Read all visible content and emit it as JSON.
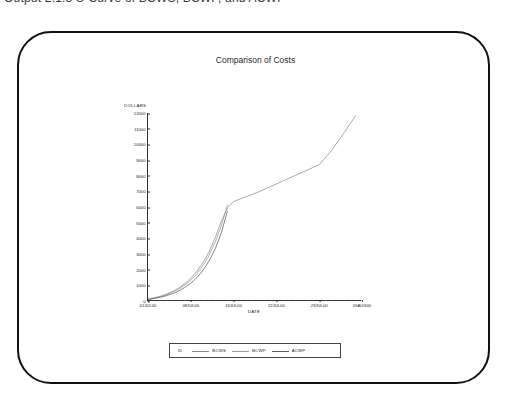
{
  "caption": {
    "text": "Output 2.1.3  S-Curve of BCWS, BCWP, and ACWP"
  },
  "frame": {
    "name": "rounded-display-frame",
    "border_color": "#111111"
  },
  "chart_data": {
    "type": "line",
    "title": "Comparison of Costs",
    "xlabel": "DATE",
    "ylabel": "DOLLARS",
    "grid": false,
    "legend_position": "bottom",
    "legend_id_label": "ID",
    "ylim": [
      0,
      12000
    ],
    "yticks": [
      0,
      1000,
      2000,
      3000,
      4000,
      5000,
      6000,
      7000,
      8000,
      9000,
      10000,
      11000,
      12000
    ],
    "ytick_labels": [
      "0",
      "1000",
      "2000",
      "3000",
      "4000",
      "5000",
      "6000",
      "7000",
      "8000",
      "9000",
      "10000",
      "11000",
      "12000"
    ],
    "xticks": [
      "01JUL00",
      "08JUL00",
      "15JUL00",
      "22JUL00",
      "29JUL00",
      "05AUG00"
    ],
    "xlim": [
      "01JUL00",
      "05AUG00"
    ],
    "x_days": [
      0,
      7,
      14,
      21,
      28,
      35
    ],
    "series": [
      {
        "name": "BCWS",
        "color": "#8c8c8c",
        "x_days": [
          0,
          1,
          2,
          3,
          4,
          5,
          6,
          7,
          8,
          9,
          10,
          11,
          12,
          13,
          14,
          16,
          18,
          20,
          22,
          24,
          26,
          28,
          30,
          32,
          34
        ],
        "values": [
          120,
          200,
          300,
          430,
          600,
          820,
          1100,
          1450,
          1900,
          2450,
          3150,
          4050,
          5100,
          5950,
          6350,
          6650,
          6950,
          7300,
          7650,
          8000,
          8350,
          8700,
          9600,
          10700,
          11850
        ]
      },
      {
        "name": "BCWP",
        "color": "#9a9a9a",
        "x_days": [
          0,
          1,
          2,
          3,
          4,
          5,
          6,
          7,
          8,
          9,
          10,
          11,
          12,
          13
        ],
        "values": [
          110,
          185,
          280,
          400,
          560,
          760,
          1010,
          1330,
          1740,
          2260,
          2920,
          3760,
          4800,
          6150
        ]
      },
      {
        "name": "ACWP",
        "color": "#5c5c5c",
        "x_days": [
          0,
          1,
          2,
          3,
          4,
          5,
          6,
          7,
          8,
          9,
          10,
          11,
          12,
          13
        ],
        "values": [
          100,
          160,
          240,
          340,
          470,
          640,
          860,
          1140,
          1500,
          1960,
          2560,
          3340,
          4360,
          5750
        ]
      }
    ]
  }
}
